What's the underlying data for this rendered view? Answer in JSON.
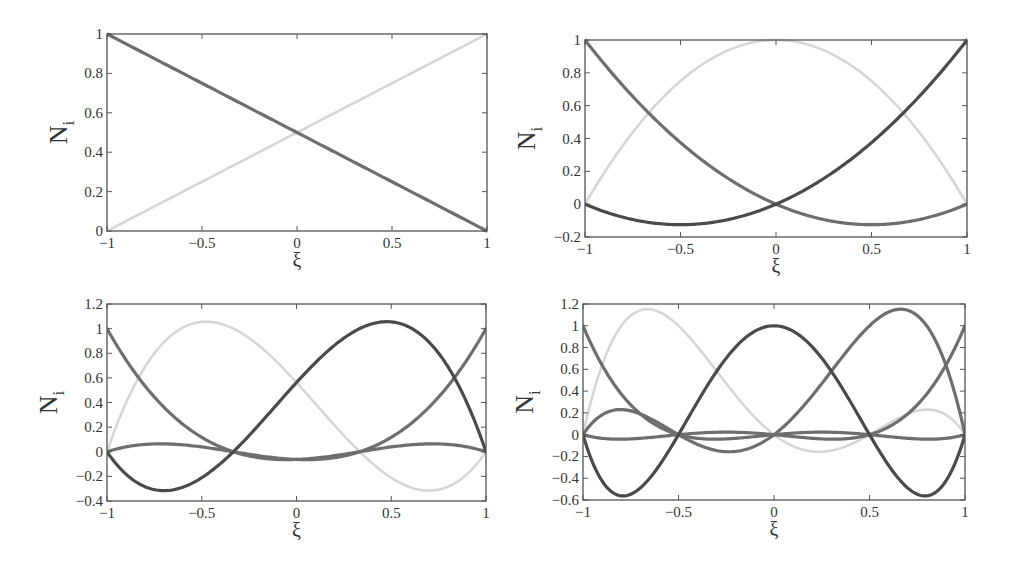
{
  "colors": {
    "axis": "#555555",
    "text": "#333333",
    "dark": "#4a4a4a",
    "medium": "#6e6e6e",
    "light": "#d6d6d6",
    "background": "#ffffff"
  },
  "chart_data": [
    {
      "type": "line",
      "panel": "top-left",
      "title": "",
      "xlabel": "ξ",
      "ylabel": "N",
      "ylabel_sub": "i",
      "xlim": [
        -1,
        1
      ],
      "ylim": [
        0,
        1
      ],
      "xticks": [
        -1,
        -0.5,
        0,
        0.5,
        1
      ],
      "xtick_labels": [
        "−1",
        "−0.5",
        "0",
        "0.5",
        "1"
      ],
      "yticks": [
        0,
        0.2,
        0.4,
        0.6,
        0.8,
        1
      ],
      "ytick_labels": [
        "0",
        "0.2",
        "0.4",
        "0.6",
        "0.8",
        "1"
      ],
      "grid": false,
      "legend": null,
      "box_px": {
        "left": 107,
        "top": 34,
        "right": 487,
        "bottom": 231
      },
      "order": 1,
      "nodes": [
        -1,
        1
      ],
      "series": [
        {
          "name": "N1",
          "node": -1,
          "color": "medium",
          "x": [
            -1,
            -0.5,
            0,
            0.5,
            1
          ],
          "values": [
            1,
            0.75,
            0.5,
            0.25,
            0
          ]
        },
        {
          "name": "N2",
          "node": 1,
          "color": "light",
          "x": [
            -1,
            -0.5,
            0,
            0.5,
            1
          ],
          "values": [
            0,
            0.25,
            0.5,
            0.75,
            1
          ]
        }
      ]
    },
    {
      "type": "line",
      "panel": "top-right",
      "title": "",
      "xlabel": "ξ",
      "ylabel": "N",
      "ylabel_sub": "i",
      "xlim": [
        -1,
        1
      ],
      "ylim": [
        -0.2,
        1
      ],
      "xticks": [
        -1,
        -0.5,
        0,
        0.5,
        1
      ],
      "xtick_labels": [
        "−1",
        "−0.5",
        "0",
        "0.5",
        "1"
      ],
      "yticks": [
        -0.2,
        0,
        0.2,
        0.4,
        0.6,
        0.8,
        1
      ],
      "ytick_labels": [
        "−0.2",
        "0",
        "0.2",
        "0.4",
        "0.6",
        "0.8",
        "1"
      ],
      "grid": false,
      "legend": null,
      "box_px": {
        "left": 585,
        "top": 40,
        "right": 967,
        "bottom": 237
      },
      "order": 2,
      "nodes": [
        -1,
        0,
        1
      ],
      "series": [
        {
          "name": "N1",
          "node": -1,
          "color": "medium",
          "x": [
            -1,
            -0.5,
            0,
            0.5,
            1
          ],
          "values": [
            1,
            0.375,
            0,
            -0.125,
            0
          ]
        },
        {
          "name": "N2",
          "node": 0,
          "color": "light",
          "x": [
            -1,
            -0.5,
            0,
            0.5,
            1
          ],
          "values": [
            0,
            0.75,
            1,
            0.75,
            0
          ]
        },
        {
          "name": "N3",
          "node": 1,
          "color": "dark",
          "x": [
            -1,
            -0.5,
            0,
            0.5,
            1
          ],
          "values": [
            0,
            -0.125,
            0,
            0.375,
            1
          ]
        }
      ]
    },
    {
      "type": "line",
      "panel": "bottom-left",
      "title": "",
      "xlabel": "ξ",
      "ylabel": "N",
      "ylabel_sub": "i",
      "xlim": [
        -1,
        1
      ],
      "ylim": [
        -0.4,
        1.2
      ],
      "xticks": [
        -1,
        -0.5,
        0,
        0.5,
        1
      ],
      "xtick_labels": [
        "−1",
        "−0.5",
        "0",
        "0.5",
        "1"
      ],
      "yticks": [
        -0.4,
        -0.2,
        0,
        0.2,
        0.4,
        0.6,
        0.8,
        1,
        1.2
      ],
      "ytick_labels": [
        "−0.4",
        "−0.2",
        "0",
        "0.2",
        "0.4",
        "0.6",
        "0.8",
        "1",
        "1.2"
      ],
      "grid": false,
      "legend": null,
      "box_px": {
        "left": 107,
        "top": 304,
        "right": 486,
        "bottom": 501
      },
      "order": 3,
      "nodes": [
        -1,
        -0.3333,
        0.3333,
        1
      ],
      "series": [
        {
          "name": "N1",
          "node": -1,
          "color": "medium",
          "x": [
            -1,
            -0.5,
            0,
            0.5,
            1
          ],
          "values": [
            1,
            0.2813,
            -0.0625,
            0.0313,
            0
          ]
        },
        {
          "name": "N2",
          "node": -0.3333,
          "color": "light",
          "x": [
            -1,
            -0.5,
            0,
            0.5,
            1
          ],
          "values": [
            0,
            1.0547,
            0.5625,
            -0.2813,
            0
          ]
        },
        {
          "name": "N3",
          "node": 0.3333,
          "color": "dark",
          "x": [
            -1,
            -0.5,
            0,
            0.5,
            1
          ],
          "values": [
            0,
            -0.2813,
            0.5625,
            1.0547,
            0
          ]
        },
        {
          "name": "N4",
          "node": 1,
          "color": "medium",
          "x": [
            -1,
            -0.5,
            0,
            0.5,
            1
          ],
          "values": [
            0,
            0.0313,
            -0.0625,
            0.2813,
            1
          ]
        }
      ],
      "extra_curves_note": "Two low-amplitude medium-gray curves near zero (max ≈ 0.06, min ≈ -0.06) and two dark curves dipping to ≈ -0.31 near ξ≈±0.7"
    },
    {
      "type": "line",
      "panel": "bottom-right",
      "title": "",
      "xlabel": "ξ",
      "ylabel": "N",
      "ylabel_sub": "i",
      "xlim": [
        -1,
        1
      ],
      "ylim": [
        -0.6,
        1.2
      ],
      "xticks": [
        -1,
        -0.5,
        0,
        0.5,
        1
      ],
      "xtick_labels": [
        "−1",
        "−0.5",
        "0",
        "0.5",
        "1"
      ],
      "yticks": [
        -0.6,
        -0.4,
        -0.2,
        0,
        0.2,
        0.4,
        0.6,
        0.8,
        1,
        1.2
      ],
      "ytick_labels": [
        "−0.6",
        "−0.4",
        "−0.2",
        "0",
        "0.2",
        "0.4",
        "0.6",
        "0.8",
        "1",
        "1.2"
      ],
      "grid": false,
      "legend": null,
      "box_px": {
        "left": 583,
        "top": 304,
        "right": 965,
        "bottom": 500
      },
      "order": 4,
      "nodes": [
        -1,
        -0.5,
        0,
        0.5,
        1
      ],
      "series": [
        {
          "name": "N1",
          "node": -1,
          "color": "medium",
          "x": [
            -1,
            -0.5,
            0,
            0.5,
            1
          ],
          "values": [
            1,
            0,
            0,
            0,
            0
          ]
        },
        {
          "name": "N2",
          "node": -0.5,
          "color": "light",
          "x": [
            -1,
            -0.5,
            0,
            0.5,
            1
          ],
          "values": [
            0,
            1,
            0,
            0,
            0
          ]
        },
        {
          "name": "N3",
          "node": 0,
          "color": "dark",
          "x": [
            -1,
            -0.5,
            0,
            0.5,
            1
          ],
          "values": [
            0,
            0,
            1,
            0,
            0
          ]
        },
        {
          "name": "N4",
          "node": 0.5,
          "color": "medium",
          "x": [
            -1,
            -0.5,
            0,
            0.5,
            1
          ],
          "values": [
            0,
            0,
            0,
            1,
            0
          ]
        },
        {
          "name": "N5",
          "node": 1,
          "color": "medium",
          "x": [
            -1,
            -0.5,
            0,
            0.5,
            1
          ],
          "values": [
            0,
            0,
            0,
            0,
            1
          ]
        }
      ],
      "peaks_note": "Light curve peaks ≈ 1.15 at ξ≈-0.65; medium curve peaks ≈ 1.15 at ξ≈0.65; dark curves dip to ≈ -0.56 near ξ≈±0.79"
    }
  ],
  "render_curves": [
    {
      "panel": 0,
      "curves": [
        {
          "nodes": [
            -1,
            1
          ],
          "i": 0,
          "color": "medium",
          "width": 3
        },
        {
          "nodes": [
            -1,
            1
          ],
          "i": 1,
          "color": "light",
          "width": 2
        }
      ]
    },
    {
      "panel": 1,
      "curves": [
        {
          "nodes": [
            -1,
            0,
            1
          ],
          "i": 1,
          "color": "light",
          "width": 2.5
        },
        {
          "nodes": [
            -1,
            0,
            1
          ],
          "i": 0,
          "color": "medium",
          "width": 3
        },
        {
          "nodes": [
            -1,
            0,
            1
          ],
          "i": 2,
          "color": "dark",
          "width": 3
        }
      ]
    },
    {
      "panel": 2,
      "curves": [
        {
          "nodes": [
            -1,
            -0.33333,
            0.33333,
            1
          ],
          "i": 1,
          "color": "light",
          "width": 2.5
        },
        {
          "nodes": [
            -1,
            -0.5,
            0.5,
            1
          ],
          "i": 0,
          "color": "medium",
          "width": 3,
          "scale": 0.0
        },
        {
          "nodes": [
            -1,
            -0.33333,
            0.33333,
            1
          ],
          "i": 0,
          "color": "medium",
          "width": 3
        },
        {
          "nodes": [
            -1,
            -0.33333,
            0.33333,
            1
          ],
          "i": 3,
          "color": "medium",
          "width": 3
        },
        {
          "nodes": [
            -1,
            -0.33333,
            0.33333,
            1
          ],
          "i": 2,
          "color": "dark",
          "width": 3
        },
        {
          "nodes": [
            -1,
            -0.33333,
            0.33333,
            1
          ],
          "i": 2,
          "color": "dark",
          "width": 3,
          "mirror": true
        }
      ]
    },
    {
      "panel": 3,
      "curves": [
        {
          "nodes": [
            -1,
            -0.5,
            0,
            0.5,
            1
          ],
          "i": 1,
          "color": "light",
          "width": 2.5
        },
        {
          "nodes": [
            -1,
            -0.5,
            0,
            0.5,
            1
          ],
          "i": 0,
          "color": "medium",
          "width": 3
        },
        {
          "nodes": [
            -1,
            -0.5,
            0,
            0.5,
            1
          ],
          "i": 4,
          "color": "medium",
          "width": 3
        },
        {
          "nodes": [
            -1,
            -0.5,
            0,
            0.5,
            1
          ],
          "i": 3,
          "color": "medium",
          "width": 3
        },
        {
          "nodes": [
            -1,
            -0.5,
            0,
            0.5,
            1
          ],
          "i": 2,
          "color": "dark",
          "width": 3
        }
      ]
    }
  ]
}
